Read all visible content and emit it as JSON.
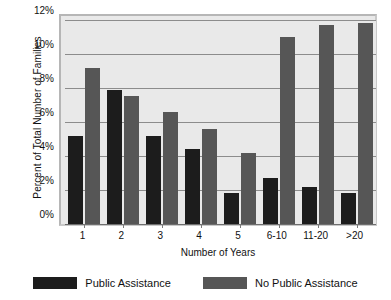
{
  "chart_data": {
    "type": "bar",
    "title": "",
    "xlabel": "Number of Years",
    "ylabel": "Percent of Total Number of Families",
    "categories": [
      "1",
      "2",
      "3",
      "4",
      "5",
      "6-10",
      "11-20",
      ">20"
    ],
    "ylim": [
      0,
      12
    ],
    "ytick_labels": [
      "0%",
      "2%",
      "4%",
      "6%",
      "8%",
      "10%",
      "12%"
    ],
    "ytick_values": [
      0,
      2,
      4,
      6,
      8,
      10,
      12
    ],
    "grid": true,
    "legend_position": "bottom",
    "series": [
      {
        "name": "Public Assistance",
        "color": "#1c1c1c",
        "values": [
          5.2,
          7.9,
          5.2,
          4.4,
          1.8,
          2.7,
          2.2,
          1.8
        ]
      },
      {
        "name": "No Public Assistance",
        "color": "#565656",
        "values": [
          9.2,
          7.5,
          6.6,
          5.6,
          4.2,
          11.0,
          11.7,
          11.8
        ]
      }
    ]
  },
  "plot": {
    "background_color": "#e9e9e9",
    "gridline_color": "#8c8c8c",
    "frame_color": "#b6b6b6"
  }
}
